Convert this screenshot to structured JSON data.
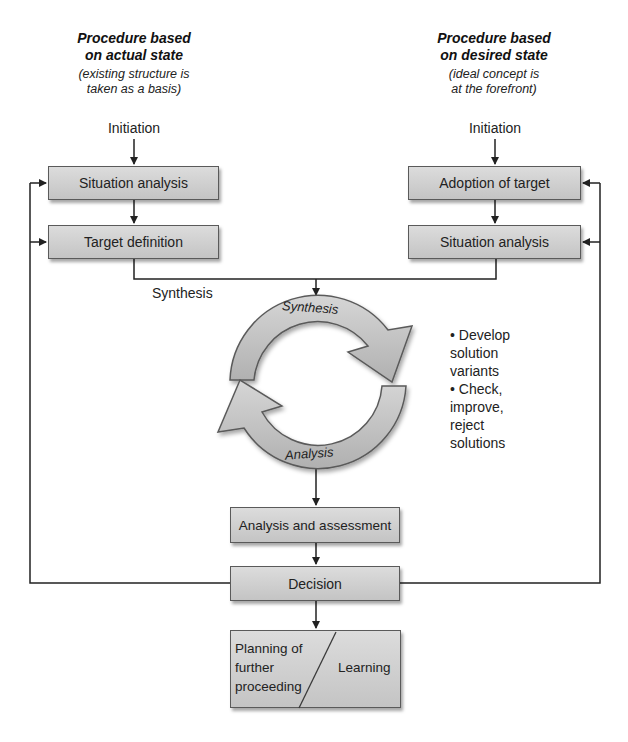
{
  "left_column": {
    "heading_line1": "Procedure based",
    "heading_line2": "on actual state",
    "sub_line1": "(existing structure is",
    "sub_line2": "taken as a basis)",
    "initiation": "Initiation",
    "box1": "Situation analysis",
    "box2": "Target definition",
    "synthesis_label": "Synthesis"
  },
  "right_column": {
    "heading_line1": "Procedure based",
    "heading_line2": "on desired state",
    "sub_line1": "(ideal concept is",
    "sub_line2": "at the forefront)",
    "initiation": "Initiation",
    "box1": "Adoption of target",
    "box2": "Situation analysis"
  },
  "cycle": {
    "top_label": "Synthesis",
    "bottom_label": "Analysis",
    "fill_color": "#c8c8c8",
    "notes": [
      "• Develop",
      "solution",
      "variants",
      "• Check,",
      "improve,",
      "reject",
      "solutions"
    ]
  },
  "lower_flow": {
    "assessment": "Analysis and assessment",
    "decision": "Decision",
    "final_left_line1": "Planning of",
    "final_left_line2": "further",
    "final_left_line3": "proceeding",
    "final_right": "Learning"
  }
}
